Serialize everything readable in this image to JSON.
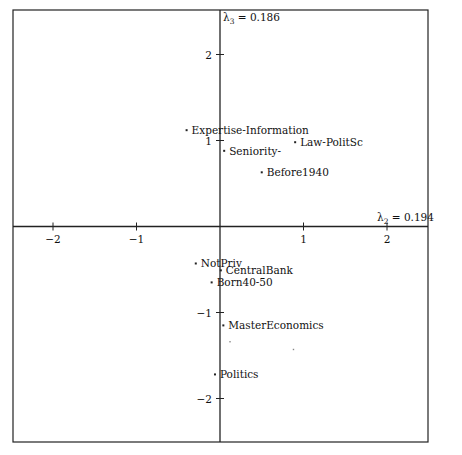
{
  "chart_data": {
    "type": "scatter",
    "title": "",
    "xlabel": "λ2 = 0.194",
    "ylabel": "λ3 = 0.186",
    "axis_labels": {
      "x": {
        "symbol": "λ",
        "sub": "2",
        "value": "= 0.194"
      },
      "y": {
        "symbol": "λ",
        "sub": "3",
        "value": "= 0.186"
      }
    },
    "xlim": [
      -2.45,
      2.5
    ],
    "ylim": [
      -2.5,
      2.5
    ],
    "xticks": [
      -2,
      -1,
      1,
      2
    ],
    "yticks": [
      2,
      1,
      -1,
      -2
    ],
    "grid": false,
    "legend": null,
    "points": [
      {
        "label": "Expertise-Information",
        "x": -0.4,
        "y": 1.12
      },
      {
        "label": "Seniority-",
        "x": 0.05,
        "y": 0.88
      },
      {
        "label": "Law-PolitSc",
        "x": 0.9,
        "y": 0.98
      },
      {
        "label": "Before1940",
        "x": 0.5,
        "y": 0.63
      },
      {
        "label": "NotPriv",
        "x": -0.29,
        "y": -0.43
      },
      {
        "label": "CentralBank",
        "x": 0.01,
        "y": -0.51
      },
      {
        "label": "Born40-50",
        "x": -0.1,
        "y": -0.65
      },
      {
        "label": "MasterEconomics",
        "x": 0.04,
        "y": -1.15
      },
      {
        "label": "Politics",
        "x": -0.06,
        "y": -1.72
      }
    ],
    "unlabeled_points": [
      {
        "x": 0.12,
        "y": -1.34
      },
      {
        "x": 0.88,
        "y": -1.43
      }
    ]
  }
}
